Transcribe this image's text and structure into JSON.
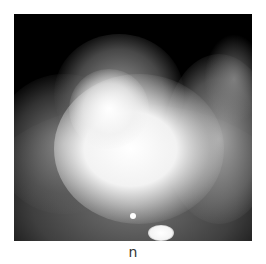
{
  "figure": {
    "caption": "n"
  }
}
